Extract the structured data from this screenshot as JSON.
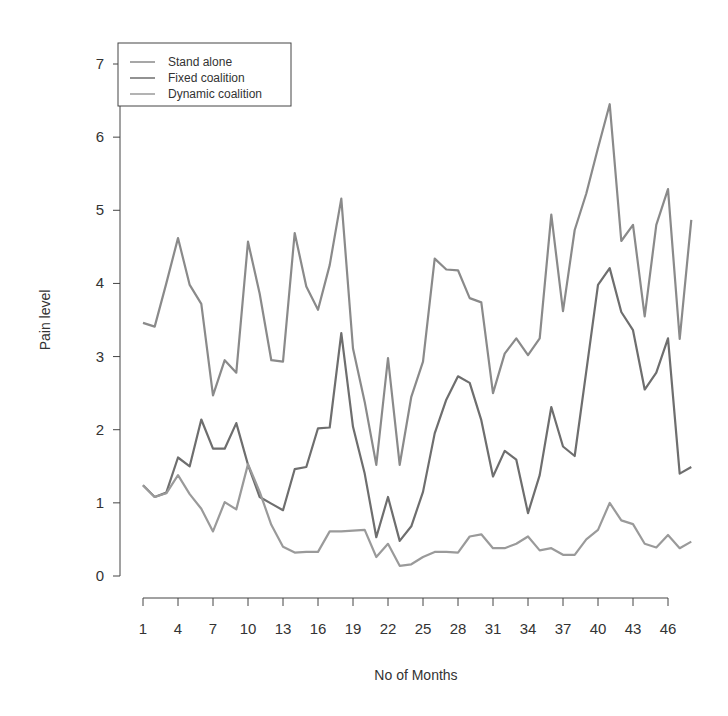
{
  "chart_data": {
    "type": "line",
    "title": "",
    "xlabel": "No of Months",
    "ylabel": "Pain level",
    "ylim": [
      0,
      7
    ],
    "yticks": [
      0,
      1,
      2,
      3,
      4,
      5,
      6,
      7
    ],
    "xlim": [
      1,
      48
    ],
    "xticks": [
      1,
      4,
      7,
      10,
      13,
      16,
      19,
      22,
      25,
      28,
      31,
      34,
      37,
      40,
      43,
      46
    ],
    "grid": false,
    "legend_position": "top-left",
    "x": [
      1,
      2,
      3,
      4,
      5,
      6,
      7,
      8,
      9,
      10,
      11,
      12,
      13,
      14,
      15,
      16,
      17,
      18,
      19,
      20,
      21,
      22,
      23,
      24,
      25,
      26,
      27,
      28,
      29,
      30,
      31,
      32,
      33,
      34,
      35,
      36,
      37,
      38,
      39,
      40,
      41,
      42,
      43,
      44,
      45,
      46,
      47,
      48
    ],
    "series": [
      {
        "name": "Stand alone",
        "color": "#8a8a8a",
        "values": [
          3.46,
          3.41,
          4.0,
          4.62,
          3.98,
          3.72,
          2.47,
          2.95,
          2.78,
          4.57,
          3.86,
          2.95,
          2.93,
          4.69,
          3.96,
          3.64,
          4.25,
          5.16,
          3.11,
          2.38,
          1.52,
          2.98,
          1.52,
          2.45,
          2.93,
          4.34,
          4.19,
          4.18,
          3.8,
          3.74,
          2.5,
          3.04,
          3.25,
          3.02,
          3.25,
          4.94,
          3.62,
          4.73,
          5.23,
          5.85,
          6.45,
          4.58,
          4.8,
          3.55,
          4.8,
          5.29,
          3.24,
          4.87
        ]
      },
      {
        "name": "Fixed coalition",
        "color": "#6e6e6e",
        "values": [
          1.24,
          1.08,
          1.14,
          1.62,
          1.5,
          2.14,
          1.74,
          1.74,
          2.09,
          1.52,
          1.08,
          0.99,
          0.9,
          1.46,
          1.49,
          2.02,
          2.03,
          3.32,
          2.04,
          1.4,
          0.53,
          1.08,
          0.48,
          0.68,
          1.15,
          1.95,
          2.41,
          2.73,
          2.64,
          2.13,
          1.36,
          1.71,
          1.59,
          0.86,
          1.38,
          2.31,
          1.77,
          1.64,
          2.8,
          3.98,
          4.21,
          3.61,
          3.36,
          2.55,
          2.78,
          3.25,
          1.4,
          1.49
        ]
      },
      {
        "name": "Dynamic coalition",
        "color": "#9a9a9a",
        "values": [
          1.24,
          1.08,
          1.13,
          1.38,
          1.12,
          0.92,
          0.61,
          1.01,
          0.91,
          1.53,
          1.15,
          0.7,
          0.4,
          0.32,
          0.33,
          0.33,
          0.61,
          0.61,
          0.62,
          0.63,
          0.26,
          0.44,
          0.14,
          0.16,
          0.26,
          0.33,
          0.33,
          0.32,
          0.54,
          0.57,
          0.38,
          0.38,
          0.44,
          0.54,
          0.35,
          0.38,
          0.29,
          0.29,
          0.5,
          0.63,
          1.0,
          0.76,
          0.71,
          0.44,
          0.39,
          0.56,
          0.38,
          0.47
        ]
      }
    ]
  },
  "legend": {
    "items": [
      "Stand alone",
      "Fixed coalition",
      "Dynamic coalition"
    ]
  },
  "axes": {
    "x_title": "No of Months",
    "y_title": "Pain level"
  }
}
